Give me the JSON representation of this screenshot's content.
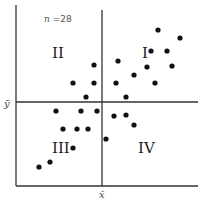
{
  "chart_data": {
    "type": "scatter",
    "title": "",
    "annotation": "n =28",
    "n": 28,
    "xlabel": "x̄",
    "ylabel": "ȳ",
    "mean_lines": {
      "x_mean_label": "x̄",
      "y_mean_label": "ȳ"
    },
    "quadrant_labels": [
      "I",
      "II",
      "III",
      "IV"
    ],
    "grid": false,
    "legend": null,
    "points_px": [
      [
        158,
        30
      ],
      [
        180,
        38
      ],
      [
        151,
        51
      ],
      [
        167,
        51
      ],
      [
        118,
        61
      ],
      [
        94,
        65
      ],
      [
        172,
        66
      ],
      [
        134,
        75
      ],
      [
        147,
        67
      ],
      [
        155,
        83
      ],
      [
        73,
        83
      ],
      [
        94,
        83
      ],
      [
        116,
        83
      ],
      [
        86,
        97
      ],
      [
        126,
        97
      ],
      [
        56,
        111
      ],
      [
        81,
        111
      ],
      [
        97,
        111
      ],
      [
        63,
        129
      ],
      [
        77,
        129
      ],
      [
        88,
        129
      ],
      [
        114,
        116
      ],
      [
        126,
        115
      ],
      [
        134,
        125
      ],
      [
        106,
        139
      ],
      [
        73,
        148
      ],
      [
        50,
        162
      ],
      [
        39,
        167
      ]
    ]
  },
  "labels": {
    "n_var": "n",
    "n_text": " =28",
    "q1": "I",
    "q2": "II",
    "q3": "III",
    "q4": "IV",
    "xbar": "x̄",
    "ybar": "ȳ"
  }
}
